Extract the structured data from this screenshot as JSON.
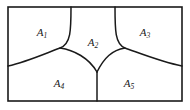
{
  "figure": {
    "type": "venn-like-region-partition-diagram",
    "stroke_color": "#1a1a1a",
    "label_color": "#1a1a1a",
    "background_color": "#ffffff",
    "frame": {
      "x": 8,
      "y": 7,
      "width": 174,
      "height": 94
    },
    "vertices": {
      "top_left_curve_top": [
        71,
        7
      ],
      "top_right_curve_top": [
        115,
        7
      ],
      "left_triple_point": [
        60,
        48
      ],
      "right_triple_point": [
        125,
        48
      ],
      "bottom_triple_point": [
        97,
        72
      ],
      "left_edge_meet": [
        8,
        66
      ],
      "right_edge_meet": [
        182,
        66
      ],
      "bottom_edge_meet": [
        97,
        101
      ]
    },
    "regions": [
      {
        "id": "A1",
        "name": "region-a1",
        "base": "A",
        "sub": "1",
        "label_x": 42,
        "label_y": 33
      },
      {
        "id": "A2",
        "name": "region-a2",
        "base": "A",
        "sub": "2",
        "label_x": 93,
        "label_y": 43
      },
      {
        "id": "A3",
        "name": "region-a3",
        "base": "A",
        "sub": "3",
        "label_x": 145,
        "label_y": 33
      },
      {
        "id": "A4",
        "name": "region-a4",
        "base": "A",
        "sub": "4",
        "label_x": 59,
        "label_y": 84
      },
      {
        "id": "A5",
        "name": "region-a5",
        "base": "A",
        "sub": "5",
        "label_x": 129,
        "label_y": 84
      }
    ]
  }
}
